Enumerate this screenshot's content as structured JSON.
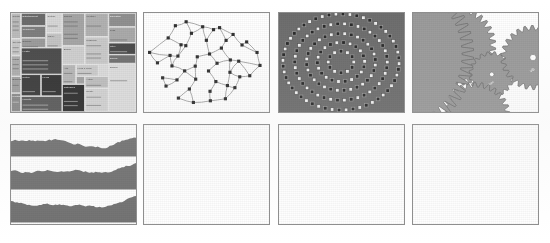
{
  "figure": {
    "background_color": "#ffffff",
    "panel_border_color": "#8d8d8d",
    "rows": 2,
    "columns": 4,
    "panel_count": 8
  },
  "panels": [
    {
      "index": 1,
      "name": "treemap",
      "type": "treemap",
      "row": 1,
      "column": 1,
      "x": 10,
      "y": 12,
      "width": 127,
      "height": 101,
      "palette": [
        "#cfcfcf",
        "#bdbdbd",
        "#9e9e9e",
        "#868686",
        "#6d6d6d",
        "#545454",
        "#3f3f3f",
        "#2b2b2b",
        "#e2e2e2"
      ],
      "label_color": "#f2f2f2",
      "cells": [
        {
          "x": 0.0,
          "y": 0.0,
          "w": 0.08,
          "h": 0.26,
          "shade": "#b9b9b9",
          "label": "Sports"
        },
        {
          "x": 0.0,
          "y": 0.26,
          "w": 0.08,
          "h": 0.17,
          "shade": "#c6c6c6",
          "label": "Top Stories"
        },
        {
          "x": 0.0,
          "y": 0.43,
          "w": 0.08,
          "h": 0.21,
          "shade": "#adadad",
          "label": "World"
        },
        {
          "x": 0.0,
          "y": 0.64,
          "w": 0.08,
          "h": 0.17,
          "shade": "#9f9f9f",
          "label": "Business"
        },
        {
          "x": 0.0,
          "y": 0.81,
          "w": 0.08,
          "h": 0.19,
          "shade": "#8a8a8a",
          "label": "Politics"
        },
        {
          "x": 0.08,
          "y": 0.0,
          "w": 0.2,
          "h": 0.13,
          "shade": "#6b6b6b",
          "label": "Entertainment"
        },
        {
          "x": 0.08,
          "y": 0.13,
          "w": 0.2,
          "h": 0.12,
          "shade": "#7d7d7d",
          "label": "Technology"
        },
        {
          "x": 0.08,
          "y": 0.25,
          "w": 0.2,
          "h": 0.1,
          "shade": "#9a9a9a",
          "label": "Science"
        },
        {
          "x": 0.08,
          "y": 0.35,
          "w": 0.33,
          "h": 0.27,
          "shade": "#4b4b4b",
          "label": "Health"
        },
        {
          "x": 0.08,
          "y": 0.62,
          "w": 0.16,
          "h": 0.22,
          "shade": "#3c3c3c",
          "label": "Nation"
        },
        {
          "x": 0.08,
          "y": 0.84,
          "w": 0.33,
          "h": 0.16,
          "shade": "#5a5a5a",
          "label": "Markets"
        },
        {
          "x": 0.24,
          "y": 0.62,
          "w": 0.17,
          "h": 0.22,
          "shade": "#333333",
          "label": "Media"
        },
        {
          "x": 0.28,
          "y": 0.0,
          "w": 0.13,
          "h": 0.2,
          "shade": "#d4d4d4",
          "label": "Culture"
        },
        {
          "x": 0.28,
          "y": 0.2,
          "w": 0.13,
          "h": 0.15,
          "shade": "#c2c2c2",
          "label": "Travel"
        },
        {
          "x": 0.41,
          "y": 0.0,
          "w": 0.18,
          "h": 0.33,
          "shade": "#a4a4a4",
          "label": "Opinion"
        },
        {
          "x": 0.41,
          "y": 0.33,
          "w": 0.18,
          "h": 0.19,
          "shade": "#cdcdcd",
          "label": "Books"
        },
        {
          "x": 0.41,
          "y": 0.52,
          "w": 0.11,
          "h": 0.2,
          "shade": "#b5b5b5",
          "label": "Arts"
        },
        {
          "x": 0.52,
          "y": 0.52,
          "w": 0.18,
          "h": 0.12,
          "shade": "#c9c9c9",
          "label": "Food & Drink"
        },
        {
          "x": 0.52,
          "y": 0.64,
          "w": 0.07,
          "h": 0.08,
          "shade": "#a0a0a0",
          "label": "Film"
        },
        {
          "x": 0.41,
          "y": 0.72,
          "w": 0.18,
          "h": 0.28,
          "shade": "#2e2e2e",
          "label": "Obituaries"
        },
        {
          "x": 0.59,
          "y": 0.0,
          "w": 0.19,
          "h": 0.24,
          "shade": "#b0b0b0",
          "label": "Weather"
        },
        {
          "x": 0.59,
          "y": 0.24,
          "w": 0.19,
          "h": 0.28,
          "shade": "#c7c7c7",
          "label": "Magazine"
        },
        {
          "x": 0.59,
          "y": 0.64,
          "w": 0.19,
          "h": 0.12,
          "shade": "#bcbcbc",
          "label": "Autos"
        },
        {
          "x": 0.59,
          "y": 0.76,
          "w": 0.19,
          "h": 0.24,
          "shade": "#d0d0d0",
          "label": "Realty"
        },
        {
          "x": 0.78,
          "y": 0.0,
          "w": 0.22,
          "h": 0.14,
          "shade": "#8f8f8f",
          "label": "Education"
        },
        {
          "x": 0.78,
          "y": 0.14,
          "w": 0.22,
          "h": 0.16,
          "shade": "#a8a8a8",
          "label": "Jobs"
        },
        {
          "x": 0.78,
          "y": 0.3,
          "w": 0.22,
          "h": 0.12,
          "shade": "#4a4a4a",
          "label": "Style"
        },
        {
          "x": 0.78,
          "y": 0.42,
          "w": 0.22,
          "h": 0.09,
          "shade": "#707070",
          "label": "Energy"
        },
        {
          "x": 0.78,
          "y": 0.51,
          "w": 0.22,
          "h": 0.49,
          "shade": "#dadada",
          "label": "Europe"
        }
      ]
    },
    {
      "index": 2,
      "name": "force-directed-mesh-graph",
      "type": "node-link-graph",
      "row": 1,
      "column": 2,
      "x": 143,
      "y": 12,
      "width": 127,
      "height": 101,
      "node_color": "#303030",
      "node_shape": "square",
      "node_count": 46,
      "edge_color": "#9c9c9c"
    },
    {
      "index": 3,
      "name": "radial-concentric-rings",
      "type": "radial-layout",
      "row": 1,
      "column": 3,
      "x": 278,
      "y": 12,
      "width": 127,
      "height": 101,
      "background_color": "#6e6e6e",
      "ring_count": 5,
      "node_colors": [
        "#ededed",
        "#2a2a2a"
      ],
      "node_shape": "square"
    },
    {
      "index": 4,
      "name": "interlocking-gears",
      "type": "mechanical-diagram",
      "row": 1,
      "column": 4,
      "x": 412,
      "y": 12,
      "width": 127,
      "height": 101,
      "gear_fill": "#9a9a9a",
      "gear_stroke": "#6a6a6a",
      "hub_color": "#ffffff",
      "gears": [
        {
          "label": "prefuse",
          "teeth": 34,
          "cx": 0.34,
          "cy": 0.33,
          "r": 0.3
        },
        {
          "label": "flare",
          "teeth": 20,
          "cx": 0.63,
          "cy": 0.62,
          "r": 0.17
        },
        {
          "label": "vis",
          "teeth": 26,
          "cx": 0.96,
          "cy": 0.45,
          "r": 0.24
        },
        {
          "label": "",
          "teeth": 30,
          "cx": 0.5,
          "cy": 1.05,
          "r": 0.26
        },
        {
          "label": "",
          "teeth": 60,
          "cx": -0.18,
          "cy": 0.42,
          "r": 0.62
        }
      ]
    },
    {
      "index": 5,
      "name": "stacked-horizon-area-charts",
      "type": "area",
      "row": 2,
      "column": 1,
      "x": 10,
      "y": 124,
      "width": 127,
      "height": 101,
      "band_count": 3,
      "area_fill": "#737373",
      "baseline_color": "#b8b8b8"
    },
    {
      "index": 6,
      "name": "indented-tree-hierarchy",
      "type": "tree",
      "row": 2,
      "column": 2,
      "x": 143,
      "y": 124,
      "width": 127,
      "height": 101,
      "row_fill": "#d2d2d2",
      "row_stroke": "#a6a6a6",
      "link_color": "#bcbcbc",
      "text_color": "#3a3a3a",
      "nodes": [
        {
          "depth": 0,
          "label": "flare"
        },
        {
          "depth": 1,
          "label": "analytics"
        },
        {
          "depth": 2,
          "label": "cluster"
        },
        {
          "depth": 3,
          "label": "AgglomerativeCluster"
        },
        {
          "depth": 3,
          "label": "CommunityStructure"
        },
        {
          "depth": 3,
          "label": "HierarchicalCluster"
        },
        {
          "depth": 3,
          "label": "MergeEdge"
        },
        {
          "depth": 2,
          "label": "graph"
        },
        {
          "depth": 3,
          "label": "BetweennessCentrality"
        },
        {
          "depth": 3,
          "label": "LinkDistance"
        },
        {
          "depth": 3,
          "label": "MaxFlowMinCut"
        },
        {
          "depth": 3,
          "label": "ShortestPaths"
        },
        {
          "depth": 3,
          "label": "SpanningTree"
        },
        {
          "depth": 2,
          "label": "optimization"
        },
        {
          "depth": 3,
          "label": "AspectRatioBanker"
        }
      ]
    },
    {
      "index": 7,
      "name": "hierarchical-edge-bundling",
      "type": "dendrogram-bundle",
      "row": 2,
      "column": 3,
      "x": 278,
      "y": 124,
      "width": 127,
      "height": 101,
      "edge_color": "#bcbcbc",
      "node_stroke": "#5a5a5a",
      "node_fill": "#ffffff",
      "text_color": "#303030",
      "source_labels": [
        "cluster",
        "graph",
        "optimization",
        "histogram"
      ],
      "target_groups": [
        [
          "AgglomerativeCluster",
          "CommunityStructure",
          "HierarchicalCluster",
          "MergeEdge"
        ],
        [
          "BetweennessCentrality",
          "LinkDistance",
          "MaxFlowMinCut",
          "ShortestPaths",
          "SpanningTree"
        ],
        [
          "AspectRatioBanker"
        ],
        [
          "Easing",
          "FunctionSequence"
        ],
        [
          "ArrayInterpolator",
          "ColorInterpolator",
          "DateInterpolator",
          "Interpolator",
          "MatrixInterpolator",
          "NumberInterpolator",
          "ObjectInterpolator",
          "PointInterpolator",
          "RectangleInterpolator"
        ],
        [
          "Arrays",
          "Colors",
          "Dates",
          "Displays",
          "Filter",
          "Geometry",
          "IEvaluable",
          "IPredicate"
        ]
      ]
    },
    {
      "index": 8,
      "name": "dense-network-graph",
      "type": "node-link-graph",
      "row": 2,
      "column": 4,
      "x": 412,
      "y": 124,
      "width": 127,
      "height": 101,
      "node_color": "#4a4a4a",
      "hub_node_color": "#8a8a8a",
      "edge_color": "#a8a8a8",
      "node_count": 68,
      "layout": "force-directed"
    }
  ]
}
